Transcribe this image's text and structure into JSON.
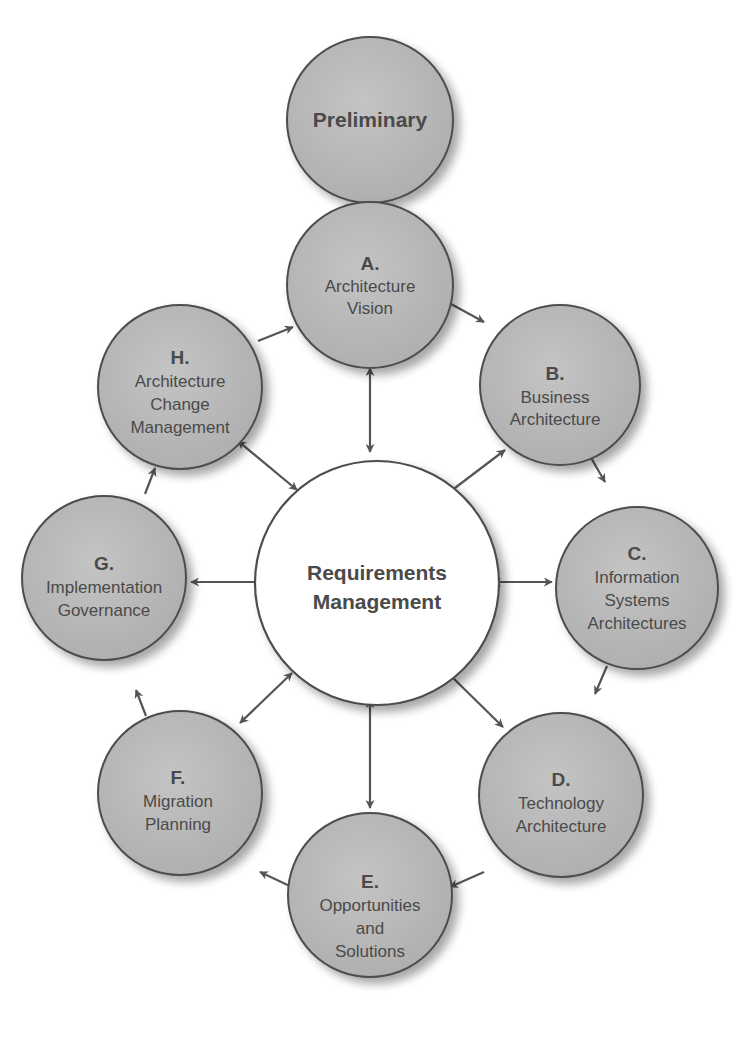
{
  "diagram": {
    "colors": {
      "node_fill": "#b9b9b9",
      "node_stroke": "#4d4d4d",
      "center_fill": "#ffffff",
      "arrow": "#555555",
      "text": "#4a4a4a"
    },
    "preliminary": {
      "label": "Preliminary"
    },
    "center": {
      "line1": "Requirements",
      "line2": "Management"
    },
    "phases": [
      {
        "id": "A",
        "letter": "A.",
        "lines": [
          "Architecture",
          "Vision"
        ]
      },
      {
        "id": "B",
        "letter": "B.",
        "lines": [
          "Business",
          "Architecture"
        ]
      },
      {
        "id": "C",
        "letter": "C.",
        "lines": [
          "Information",
          "Systems",
          "Architectures"
        ]
      },
      {
        "id": "D",
        "letter": "D.",
        "lines": [
          "Technology",
          "Architecture"
        ]
      },
      {
        "id": "E",
        "letter": "E.",
        "lines": [
          "Opportunities",
          "and",
          "Solutions"
        ]
      },
      {
        "id": "F",
        "letter": "F.",
        "lines": [
          "Migration",
          "Planning"
        ]
      },
      {
        "id": "G",
        "letter": "G.",
        "lines": [
          "Implementation",
          "Governance"
        ]
      },
      {
        "id": "H",
        "letter": "H.",
        "lines": [
          "Architecture",
          "Change",
          "Management"
        ]
      }
    ],
    "connections": {
      "cycle": [
        "A→B",
        "B→C",
        "C→D",
        "D→E",
        "E→F",
        "F→G",
        "G→H",
        "H→A"
      ],
      "bidirectional": [
        "Preliminary↔A",
        "A↔Center",
        "B↔Center",
        "C↔Center",
        "D↔Center",
        "E↔Center",
        "F↔Center",
        "G↔Center",
        "H↔Center"
      ]
    }
  }
}
